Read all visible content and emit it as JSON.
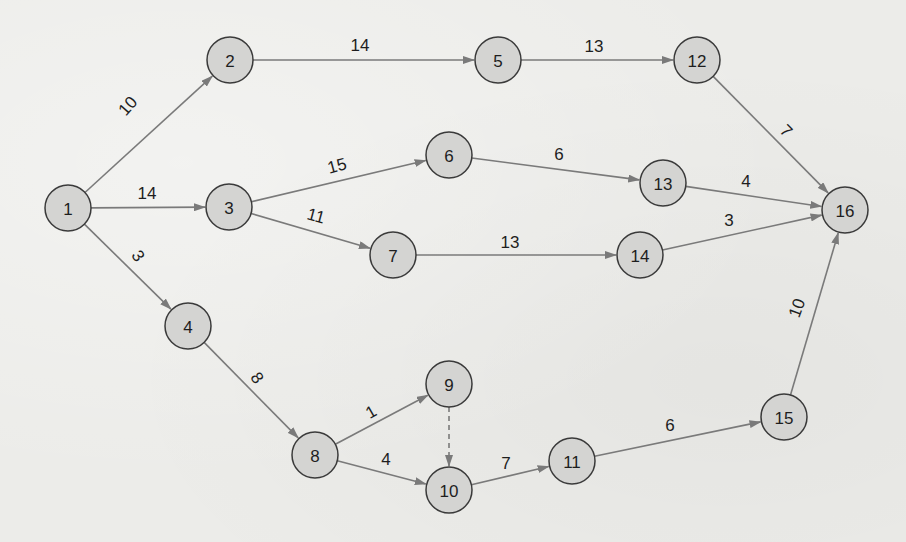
{
  "diagram": {
    "type": "activity-on-arrow network",
    "colors": {
      "background": "#ecece9",
      "node_fill": "#d4d4d2",
      "node_stroke": "#3a3a3a",
      "edge": "#7a7a7a",
      "text": "#1e1e1e"
    },
    "nodes": [
      {
        "id": "1",
        "label": "1",
        "x": 68,
        "y": 208
      },
      {
        "id": "2",
        "label": "2",
        "x": 230,
        "y": 60
      },
      {
        "id": "3",
        "label": "3",
        "x": 229,
        "y": 207
      },
      {
        "id": "4",
        "label": "4",
        "x": 188,
        "y": 326
      },
      {
        "id": "5",
        "label": "5",
        "x": 498,
        "y": 60
      },
      {
        "id": "6",
        "label": "6",
        "x": 449,
        "y": 155
      },
      {
        "id": "7",
        "label": "7",
        "x": 393,
        "y": 255
      },
      {
        "id": "8",
        "label": "8",
        "x": 315,
        "y": 455
      },
      {
        "id": "9",
        "label": "9",
        "x": 449,
        "y": 384
      },
      {
        "id": "10",
        "label": "10",
        "x": 449,
        "y": 490
      },
      {
        "id": "11",
        "label": "11",
        "x": 572,
        "y": 461
      },
      {
        "id": "12",
        "label": "12",
        "x": 697,
        "y": 60
      },
      {
        "id": "13",
        "label": "13",
        "x": 663,
        "y": 183
      },
      {
        "id": "14",
        "label": "14",
        "x": 640,
        "y": 255
      },
      {
        "id": "15",
        "label": "15",
        "x": 784,
        "y": 417
      },
      {
        "id": "16",
        "label": "16",
        "x": 845,
        "y": 210
      }
    ],
    "edges": [
      {
        "from": "1",
        "to": "2",
        "label": "10",
        "lx": 128,
        "ly": 106,
        "rot": -48
      },
      {
        "from": "1",
        "to": "3",
        "label": "14",
        "lx": 147,
        "ly": 193,
        "rot": 0
      },
      {
        "from": "1",
        "to": "4",
        "label": "3",
        "lx": 138,
        "ly": 256,
        "rot": 55
      },
      {
        "from": "2",
        "to": "5",
        "label": "14",
        "lx": 360,
        "ly": 45,
        "rot": 0
      },
      {
        "from": "5",
        "to": "12",
        "label": "13",
        "lx": 594,
        "ly": 46,
        "rot": 0
      },
      {
        "from": "3",
        "to": "6",
        "label": "15",
        "lx": 337,
        "ly": 166,
        "rot": -15
      },
      {
        "from": "3",
        "to": "7",
        "label": "11",
        "lx": 316,
        "ly": 216,
        "rot": 15
      },
      {
        "from": "6",
        "to": "13",
        "label": "6",
        "lx": 559,
        "ly": 154,
        "rot": 0
      },
      {
        "from": "7",
        "to": "14",
        "label": "13",
        "lx": 510,
        "ly": 242,
        "rot": 0
      },
      {
        "from": "12",
        "to": "16",
        "label": "7",
        "lx": 786,
        "ly": 131,
        "rot": 45
      },
      {
        "from": "13",
        "to": "16",
        "label": "4",
        "lx": 746,
        "ly": 181,
        "rot": 0
      },
      {
        "from": "14",
        "to": "16",
        "label": "3",
        "lx": 729,
        "ly": 220,
        "rot": 0
      },
      {
        "from": "4",
        "to": "8",
        "label": "8",
        "lx": 257,
        "ly": 378,
        "rot": 55
      },
      {
        "from": "8",
        "to": "9",
        "label": "1",
        "lx": 371,
        "ly": 412,
        "rot": -30
      },
      {
        "from": "8",
        "to": "10",
        "label": "4",
        "lx": 386,
        "ly": 459,
        "rot": 0
      },
      {
        "from": "9",
        "to": "10",
        "label": "",
        "dummy": true
      },
      {
        "from": "10",
        "to": "11",
        "label": "7",
        "lx": 506,
        "ly": 463,
        "rot": 0
      },
      {
        "from": "11",
        "to": "15",
        "label": "6",
        "lx": 670,
        "ly": 425,
        "rot": 0
      },
      {
        "from": "15",
        "to": "16",
        "label": "10",
        "lx": 797,
        "ly": 308,
        "rot": -70
      }
    ],
    "node_radius": 23
  }
}
